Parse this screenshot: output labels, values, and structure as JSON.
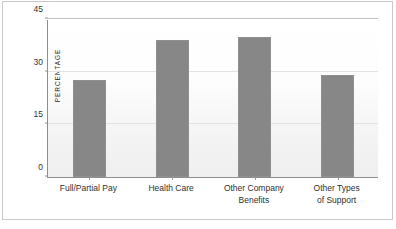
{
  "chart_data": {
    "type": "bar",
    "title": "",
    "xlabel": "",
    "ylabel": "PERCENTAGE",
    "categories": [
      "Full/Partial Pay",
      "Health Care",
      "Other Company\nBenefits",
      "Other Types\nof Support"
    ],
    "values": [
      27.5,
      39,
      40,
      29
    ],
    "ylim": [
      0,
      45
    ],
    "yticks": [
      0,
      15,
      30,
      45
    ],
    "ytick_labels": [
      "0",
      "15",
      "30",
      "45"
    ],
    "grid": true,
    "legend": null,
    "bar_color": "#878787",
    "plot_background": "#fbfbfb",
    "axis_color": "#8e8e8e",
    "gridline_color": "#e2e2e2"
  },
  "figure": {
    "background": "#ffffff",
    "frame_color": "#c9c9c9"
  }
}
